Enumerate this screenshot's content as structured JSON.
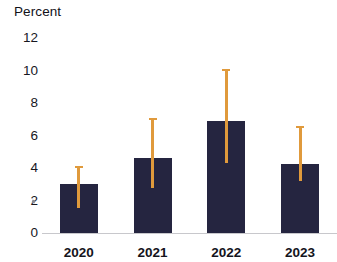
{
  "chart_data": {
    "type": "bar",
    "title": "",
    "subtitle": "",
    "xlabel": "",
    "ylabel": "Percent",
    "categories": [
      "2020",
      "2021",
      "2022",
      "2023"
    ],
    "values": [
      3.0,
      4.6,
      6.9,
      4.25
    ],
    "series": [
      {
        "name": "Percent",
        "values": [
          3.0,
          4.6,
          6.9,
          4.25
        ],
        "error_low": [
          1.55,
          2.8,
          4.3,
          3.2
        ],
        "error_high": [
          4.1,
          7.1,
          10.1,
          6.6
        ]
      }
    ],
    "ylim": [
      0,
      12
    ],
    "yticks": [
      0,
      2,
      4,
      6,
      8,
      10,
      12
    ],
    "ytick_labels": [
      "0",
      "2",
      "4",
      "6",
      "8",
      "10",
      "12"
    ],
    "grid": false,
    "legend": "none",
    "bar_color": "#252540",
    "error_bar_color": "#e09a3c",
    "axis_color": "#c8c8cc",
    "background": "#ffffff"
  },
  "axis": {
    "y_title": "Percent"
  }
}
